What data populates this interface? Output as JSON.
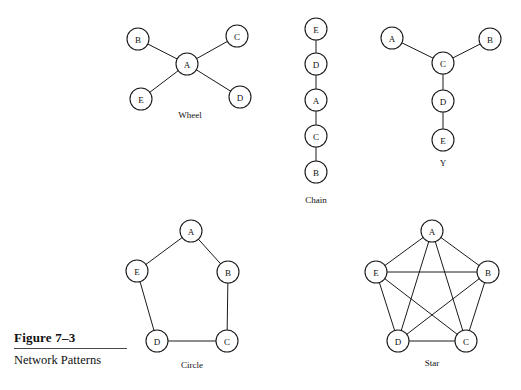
{
  "figure": {
    "number": "Figure 7–3",
    "title": "Network Patterns"
  },
  "patterns": [
    {
      "id": "wheel",
      "caption": "Wheel",
      "caption_x": 190,
      "caption_y": 118,
      "node_radius": 11,
      "nodes": [
        {
          "label": "A",
          "x": 187,
          "y": 64
        },
        {
          "label": "B",
          "x": 138,
          "y": 39
        },
        {
          "label": "C",
          "x": 237,
          "y": 36
        },
        {
          "label": "D",
          "x": 240,
          "y": 97
        },
        {
          "label": "E",
          "x": 141,
          "y": 99
        }
      ],
      "edges": [
        [
          "A",
          "B"
        ],
        [
          "A",
          "C"
        ],
        [
          "A",
          "D"
        ],
        [
          "A",
          "E"
        ]
      ]
    },
    {
      "id": "chain",
      "caption": "Chain",
      "caption_x": 316,
      "caption_y": 203,
      "node_radius": 11,
      "nodes": [
        {
          "label": "E",
          "x": 316,
          "y": 29
        },
        {
          "label": "D",
          "x": 316,
          "y": 64
        },
        {
          "label": "A",
          "x": 316,
          "y": 100
        },
        {
          "label": "C",
          "x": 316,
          "y": 136
        },
        {
          "label": "B",
          "x": 316,
          "y": 172
        }
      ],
      "edges": [
        [
          "E",
          "D"
        ],
        [
          "D",
          "A"
        ],
        [
          "A",
          "C"
        ],
        [
          "C",
          "B"
        ]
      ]
    },
    {
      "id": "y",
      "caption": "Y",
      "caption_x": 443,
      "caption_y": 166,
      "node_radius": 11,
      "nodes": [
        {
          "label": "A",
          "x": 392,
          "y": 38
        },
        {
          "label": "B",
          "x": 490,
          "y": 39
        },
        {
          "label": "C",
          "x": 443,
          "y": 63
        },
        {
          "label": "D",
          "x": 443,
          "y": 101
        },
        {
          "label": "E",
          "x": 443,
          "y": 140
        }
      ],
      "edges": [
        [
          "A",
          "C"
        ],
        [
          "B",
          "C"
        ],
        [
          "C",
          "D"
        ],
        [
          "D",
          "E"
        ]
      ]
    },
    {
      "id": "circle",
      "caption": "Circle",
      "caption_x": 192,
      "caption_y": 368,
      "node_radius": 11,
      "nodes": [
        {
          "label": "A",
          "x": 191,
          "y": 231
        },
        {
          "label": "B",
          "x": 228,
          "y": 272
        },
        {
          "label": "C",
          "x": 227,
          "y": 341
        },
        {
          "label": "D",
          "x": 157,
          "y": 341
        },
        {
          "label": "E",
          "x": 137,
          "y": 271
        }
      ],
      "edges": [
        [
          "A",
          "B"
        ],
        [
          "B",
          "C"
        ],
        [
          "C",
          "D"
        ],
        [
          "D",
          "E"
        ],
        [
          "E",
          "A"
        ]
      ]
    },
    {
      "id": "star",
      "caption": "Star",
      "caption_x": 432,
      "caption_y": 366,
      "node_radius": 11,
      "nodes": [
        {
          "label": "A",
          "x": 432,
          "y": 231
        },
        {
          "label": "B",
          "x": 488,
          "y": 272
        },
        {
          "label": "C",
          "x": 466,
          "y": 341
        },
        {
          "label": "D",
          "x": 398,
          "y": 341
        },
        {
          "label": "E",
          "x": 376,
          "y": 272
        }
      ],
      "edges": [
        [
          "A",
          "B"
        ],
        [
          "A",
          "C"
        ],
        [
          "A",
          "D"
        ],
        [
          "A",
          "E"
        ],
        [
          "B",
          "C"
        ],
        [
          "B",
          "D"
        ],
        [
          "B",
          "E"
        ],
        [
          "C",
          "D"
        ],
        [
          "C",
          "E"
        ],
        [
          "D",
          "E"
        ]
      ]
    }
  ],
  "colors": {
    "ink": "#1a1a1a",
    "paper": "#ffffff",
    "rule": "#4a4a4a"
  }
}
